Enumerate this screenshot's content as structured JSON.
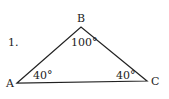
{
  "problem_number": "1.",
  "vertices": {
    "A": {
      "label": "A",
      "angle": "40°"
    },
    "B": {
      "label": "B",
      "angle": "100°"
    },
    "C": {
      "label": "C",
      "angle": "40°"
    }
  },
  "colors": {
    "stroke": "#222222",
    "background": "#ffffff"
  }
}
